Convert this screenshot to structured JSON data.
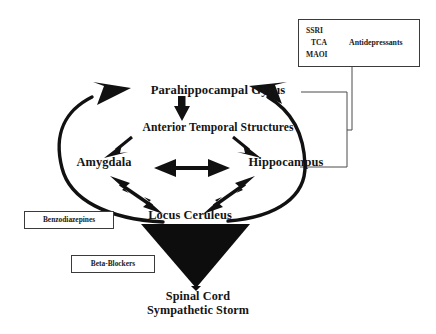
{
  "diagram": {
    "background_color": "#ffffff",
    "ink_color": "#141414",
    "nodes": [
      {
        "id": "parahippocampal_gyrus",
        "label": "Parahippocampal Gyrus"
      },
      {
        "id": "anterior_temporal_structures",
        "label": "Anterior Temporal Structures"
      },
      {
        "id": "amygdala",
        "label": "Amygdala"
      },
      {
        "id": "hippocampus",
        "label": "Hippocampus"
      },
      {
        "id": "locus_ceruleus",
        "label": "Locus Ceruleus"
      },
      {
        "id": "spinal_cord",
        "label": "Spinal Cord"
      },
      {
        "id": "sympathetic_storm",
        "label": "Sympathetic Storm"
      }
    ],
    "outcome": {
      "line1": "Spinal Cord",
      "line2": "Sympathetic Storm"
    },
    "drug_boxes": [
      {
        "id": "benzodiazepines",
        "label": "Benzodiazepines"
      },
      {
        "id": "beta_blockers",
        "label": "Beta-Blockers"
      }
    ],
    "antidepressant_box": {
      "class_label": "Antidepressants",
      "agents": [
        "SSRI",
        "TCA",
        "MAOI"
      ]
    },
    "edges": [
      {
        "from": "parahippocampal_gyrus",
        "to": "anterior_temporal_structures",
        "style": "thick-arrow-down"
      },
      {
        "from": "anterior_temporal_structures",
        "to": "amygdala",
        "style": "thick-arrow-diagonal"
      },
      {
        "from": "anterior_temporal_structures",
        "to": "hippocampus",
        "style": "thick-arrow-diagonal"
      },
      {
        "from": "amygdala",
        "to": "hippocampus",
        "style": "double-headed-horizontal"
      },
      {
        "from": "amygdala",
        "to": "locus_ceruleus",
        "style": "double-headed-diagonal"
      },
      {
        "from": "hippocampus",
        "to": "locus_ceruleus",
        "style": "double-headed-diagonal"
      },
      {
        "from": "locus_ceruleus",
        "to": "parahippocampal_gyrus",
        "style": "curved-arc-left"
      },
      {
        "from": "locus_ceruleus",
        "to": "parahippocampal_gyrus",
        "style": "curved-arc-right"
      },
      {
        "from": "locus_ceruleus",
        "to": "spinal_cord",
        "style": "solid-triangle-down"
      },
      {
        "from": "antidepressant_box",
        "to": "circuit-bracket",
        "style": "thin-connector"
      }
    ]
  }
}
